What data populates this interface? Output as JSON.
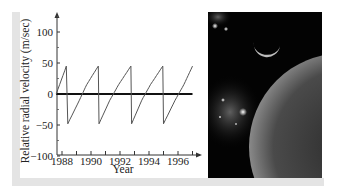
{
  "chart_data": {
    "type": "line",
    "title": "",
    "xlabel": "Year",
    "ylabel": "Relative radial velocity (m/sec)",
    "xlim": [
      1987.6,
      1997.2
    ],
    "ylim": [
      -100,
      125
    ],
    "x_ticks": [
      1988,
      1990,
      1992,
      1994,
      1996
    ],
    "x_minor_ticks": [
      1988,
      1989,
      1990,
      1991,
      1992,
      1993,
      1994,
      1995,
      1996,
      1997
    ],
    "y_ticks": [
      100,
      50,
      0,
      -50,
      -100
    ],
    "y_tick_labels": [
      "100",
      "50",
      "0",
      "−50",
      "−100"
    ],
    "grid": false,
    "legend": null,
    "reference_line": {
      "y": 0,
      "x_from": 1987.6,
      "x_to": 1997.0
    },
    "series": [
      {
        "name": "Radial velocity",
        "description": "Periodic sawtooth-like curve (orbital period approx. 2.2 years), rising gradually from about -48 to +45 m/s then dropping sharply",
        "points": [
          [
            1987.6,
            0
          ],
          [
            1988.3,
            45
          ],
          [
            1988.4,
            -48
          ],
          [
            1989.2,
            -10
          ],
          [
            1989.7,
            15
          ],
          [
            1990.5,
            45
          ],
          [
            1990.55,
            -48
          ],
          [
            1991.3,
            -10
          ],
          [
            1991.9,
            15
          ],
          [
            1992.75,
            45
          ],
          [
            1992.8,
            -48
          ],
          [
            1993.5,
            -10
          ],
          [
            1994.1,
            15
          ],
          [
            1994.95,
            45
          ],
          [
            1995.0,
            -48
          ],
          [
            1995.8,
            -10
          ],
          [
            1996.4,
            15
          ],
          [
            1997.0,
            45
          ]
        ]
      }
    ]
  },
  "photo": {
    "description": "Space scene with crescent moon, star cluster, and large planet",
    "alt": "space-illustration"
  }
}
